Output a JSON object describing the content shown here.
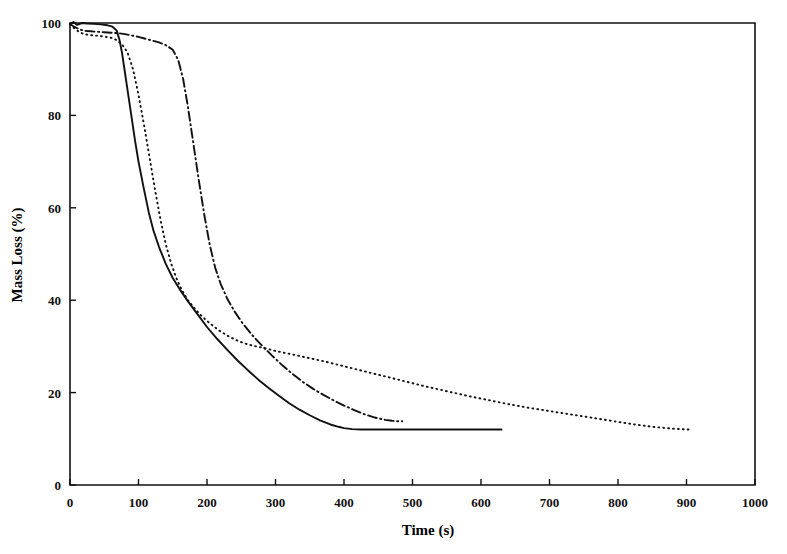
{
  "figure": {
    "title": "",
    "background_color": "#ffffff",
    "line_color": "#111111"
  },
  "chart_data": {
    "type": "line",
    "title": "",
    "subtitle": "",
    "xlabel": "Time (s)",
    "ylabel": "Mass Loss (%)",
    "xlim": [
      0,
      1000
    ],
    "ylim": [
      0,
      100
    ],
    "xticks": [
      0,
      100,
      200,
      300,
      400,
      500,
      600,
      700,
      800,
      900,
      1000
    ],
    "xtick_labels": [
      "0",
      "100",
      "200",
      "300",
      "400",
      "500",
      "600",
      "700",
      "800",
      "900",
      "1000"
    ],
    "yticks": [
      0,
      20,
      40,
      60,
      80,
      100
    ],
    "ytick_labels": [
      "0",
      "20",
      "40",
      "60",
      "80",
      "100"
    ],
    "grid": false,
    "legend": null,
    "legend_position": "none",
    "axis_style": "box-right-top-open",
    "series": [
      {
        "name": "Curve 1 (solid)",
        "linestyle": "solid",
        "color": "#111111",
        "x": [
          0,
          5,
          10,
          18,
          25,
          35,
          45,
          55,
          62,
          68,
          72,
          76,
          80,
          85,
          90,
          95,
          100,
          108,
          115,
          122,
          130,
          140,
          150,
          160,
          172,
          185,
          200,
          215,
          230,
          245,
          260,
          275,
          290,
          305,
          320,
          335,
          350,
          365,
          380,
          392,
          400,
          412,
          425,
          450,
          480,
          510,
          540,
          570,
          600,
          630
        ],
        "y": [
          99.8,
          100.2,
          99.6,
          100.0,
          99.9,
          99.8,
          99.7,
          99.5,
          99.2,
          98.4,
          96.5,
          93.5,
          89.5,
          84.5,
          79.5,
          74.5,
          70.0,
          64.0,
          59.0,
          55.0,
          51.5,
          47.8,
          44.8,
          42.4,
          39.8,
          37.2,
          34.2,
          31.6,
          29.2,
          26.9,
          24.8,
          22.8,
          21.0,
          19.3,
          17.7,
          16.3,
          15.1,
          14.0,
          13.1,
          12.6,
          12.3,
          12.1,
          12.0,
          12.0,
          12.0,
          12.0,
          12.0,
          12.0,
          12.0,
          12.0
        ]
      },
      {
        "name": "Curve 2 (dotted)",
        "linestyle": "dotted",
        "color": "#111111",
        "x": [
          0,
          5,
          12,
          20,
          28,
          36,
          44,
          52,
          60,
          68,
          76,
          84,
          92,
          100,
          108,
          116,
          124,
          132,
          140,
          148,
          156,
          164,
          172,
          182,
          192,
          204,
          216,
          230,
          245,
          260,
          275,
          290,
          300,
          320,
          345,
          370,
          400,
          430,
          460,
          490,
          520,
          550,
          580,
          610,
          640,
          670,
          700,
          730,
          760,
          790,
          820,
          850,
          880,
          905
        ],
        "y": [
          99.7,
          99.0,
          98.2,
          97.6,
          97.4,
          97.3,
          97.2,
          97.0,
          96.8,
          96.3,
          95.4,
          93.6,
          90.0,
          84.5,
          78.0,
          71.0,
          64.0,
          57.5,
          52.0,
          47.8,
          44.5,
          42.0,
          40.0,
          38.2,
          36.6,
          35.0,
          33.6,
          32.3,
          31.2,
          30.4,
          29.9,
          29.4,
          29.0,
          28.4,
          27.6,
          26.8,
          25.7,
          24.6,
          23.5,
          22.4,
          21.3,
          20.3,
          19.3,
          18.4,
          17.5,
          16.7,
          16.0,
          15.3,
          14.6,
          13.9,
          13.2,
          12.6,
          12.2,
          12.0
        ]
      },
      {
        "name": "Curve 3 (dash-dot)",
        "linestyle": "dashdot",
        "color": "#111111",
        "x": [
          0,
          6,
          14,
          22,
          30,
          40,
          50,
          60,
          70,
          80,
          90,
          100,
          110,
          120,
          130,
          140,
          150,
          158,
          165,
          172,
          180,
          188,
          196,
          204,
          212,
          220,
          230,
          240,
          252,
          265,
          280,
          295,
          310,
          325,
          340,
          355,
          370,
          385,
          400,
          415,
          430,
          445,
          460,
          470,
          478,
          485
        ],
        "y": [
          99.8,
          99.2,
          98.6,
          98.3,
          98.2,
          98.1,
          98.0,
          97.9,
          97.8,
          97.6,
          97.3,
          97.0,
          96.6,
          96.2,
          95.8,
          95.2,
          94.2,
          92.0,
          88.0,
          82.0,
          74.0,
          66.0,
          58.5,
          52.0,
          47.0,
          43.5,
          40.2,
          37.6,
          35.0,
          32.6,
          30.2,
          28.0,
          25.9,
          24.0,
          22.3,
          20.8,
          19.5,
          18.3,
          17.2,
          16.2,
          15.3,
          14.6,
          14.1,
          13.9,
          13.8,
          13.8
        ]
      }
    ]
  }
}
